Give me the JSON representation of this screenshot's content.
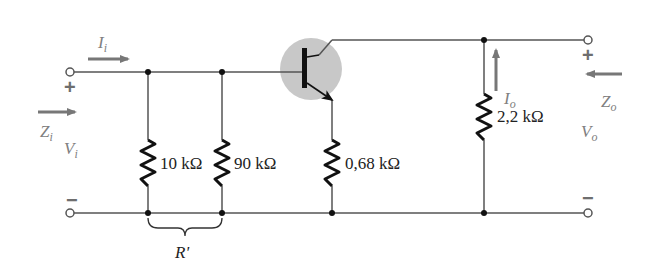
{
  "diagram": {
    "type": "BJT emitter-follower small-signal circuit",
    "input": {
      "current": {
        "symbol": "I",
        "sub": "i"
      },
      "impedance": {
        "symbol": "Z",
        "sub": "i"
      },
      "voltage": {
        "symbol": "V",
        "sub": "i"
      },
      "plus": "+",
      "minus": "−"
    },
    "output": {
      "current": {
        "symbol": "I",
        "sub": "o"
      },
      "impedance": {
        "symbol": "Z",
        "sub": "o"
      },
      "voltage": {
        "symbol": "V",
        "sub": "o"
      },
      "plus": "+",
      "minus": "−"
    },
    "resistors": [
      {
        "id": "R1",
        "label": "10 kΩ"
      },
      {
        "id": "R2",
        "label": "90 kΩ"
      },
      {
        "id": "RE",
        "label": "0,68 kΩ"
      },
      {
        "id": "RL",
        "label": "2,2 kΩ"
      }
    ],
    "bracket_label": "R'",
    "colors": {
      "wire": "#555555",
      "resistor": "#111111",
      "annotation": "#808080",
      "transistor_highlight": "#c8c8c8"
    }
  }
}
